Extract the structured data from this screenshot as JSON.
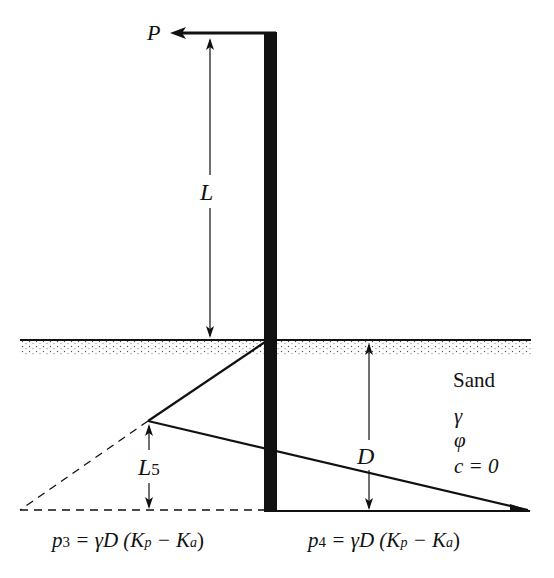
{
  "diagram": {
    "load_label": "P",
    "cantilever_length_label": "L",
    "embedment_depth_label": "D",
    "zero_pressure_offset_label": "L",
    "zero_pressure_offset_subscript": "5",
    "soil": {
      "name": "Sand",
      "unit_weight_symbol": "γ",
      "friction_angle_symbol": "φ",
      "cohesion": "c = 0"
    },
    "pressure_left": {
      "p": "p",
      "sub": "3",
      "eq": " = γD (K",
      "kp_sub": "p",
      "minus": " − K",
      "ka_sub": "a",
      "close": ")"
    },
    "pressure_right": {
      "p": "p",
      "sub": "4",
      "eq": " = γD (K",
      "kp_sub": "p",
      "minus": " − K",
      "ka_sub": "a",
      "close": ")"
    }
  }
}
